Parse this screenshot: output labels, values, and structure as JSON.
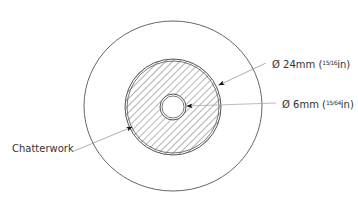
{
  "diagram": {
    "labels": {
      "outer_diameter": {
        "prefix": "Ø 24mm (",
        "fraction": "15/16",
        "suffix": "in)"
      },
      "inner_diameter": {
        "prefix": "Ø 6mm (",
        "fraction": "15/64",
        "suffix": "in)"
      },
      "chatterwork": "Chatterwork"
    },
    "colors": {
      "stroke": "#555555",
      "hatch": "#666666",
      "leader": "#999999",
      "text": "#333333"
    }
  }
}
